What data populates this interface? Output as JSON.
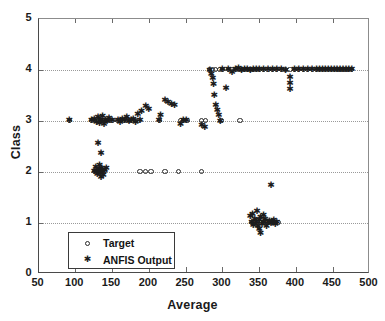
{
  "chart_data": {
    "type": "scatter",
    "title": "",
    "xlabel": "Average",
    "ylabel": "Class",
    "xlim": [
      50,
      500
    ],
    "ylim": [
      0,
      5
    ],
    "xticks": [
      50,
      100,
      150,
      200,
      250,
      300,
      350,
      400,
      450,
      500
    ],
    "yticks": [
      0,
      1,
      2,
      3,
      4,
      5
    ],
    "grid": "horizontal-dotted",
    "legend_position": "lower-left-inside",
    "legend": [
      {
        "label": "Target",
        "marker": "circle-open"
      },
      {
        "label": "ANFIS Output",
        "marker": "asterisk"
      }
    ],
    "series": [
      {
        "name": "Target",
        "marker": "circle-open",
        "points": [
          [
            92,
            3
          ],
          [
            122,
            3
          ],
          [
            126,
            3
          ],
          [
            130,
            3
          ],
          [
            132,
            3
          ],
          [
            134,
            3
          ],
          [
            136,
            3
          ],
          [
            138,
            3
          ],
          [
            140,
            3
          ],
          [
            143,
            3
          ],
          [
            146,
            3
          ],
          [
            150,
            3
          ],
          [
            158,
            3
          ],
          [
            162,
            3
          ],
          [
            166,
            3
          ],
          [
            170,
            3
          ],
          [
            174,
            3
          ],
          [
            178,
            3
          ],
          [
            182,
            3
          ],
          [
            186,
            3
          ],
          [
            214,
            3
          ],
          [
            243,
            3
          ],
          [
            247,
            3
          ],
          [
            252,
            3
          ],
          [
            272,
            3
          ],
          [
            277,
            3
          ],
          [
            298,
            3
          ],
          [
            324,
            3
          ],
          [
            126,
            2
          ],
          [
            130,
            2
          ],
          [
            133,
            2
          ],
          [
            136,
            2
          ],
          [
            139,
            2
          ],
          [
            188,
            2
          ],
          [
            196,
            2
          ],
          [
            203,
            2
          ],
          [
            222,
            2
          ],
          [
            240,
            2
          ],
          [
            272,
            2
          ],
          [
            283,
            4
          ],
          [
            287,
            4
          ],
          [
            291,
            4
          ],
          [
            296,
            4
          ],
          [
            300,
            4
          ],
          [
            308,
            4
          ],
          [
            313,
            4
          ],
          [
            318,
            4
          ],
          [
            322,
            4
          ],
          [
            326,
            4
          ],
          [
            330,
            4
          ],
          [
            334,
            4
          ],
          [
            338,
            4
          ],
          [
            342,
            4
          ],
          [
            346,
            4
          ],
          [
            350,
            4
          ],
          [
            356,
            4
          ],
          [
            362,
            4
          ],
          [
            368,
            4
          ],
          [
            374,
            4
          ],
          [
            380,
            4
          ],
          [
            386,
            4
          ],
          [
            392,
            4
          ],
          [
            398,
            4
          ],
          [
            404,
            4
          ],
          [
            410,
            4
          ],
          [
            416,
            4
          ],
          [
            422,
            4
          ],
          [
            428,
            4
          ],
          [
            432,
            4
          ],
          [
            436,
            4
          ],
          [
            440,
            4
          ],
          [
            444,
            4
          ],
          [
            448,
            4
          ],
          [
            452,
            4
          ],
          [
            456,
            4
          ],
          [
            460,
            4
          ],
          [
            464,
            4
          ],
          [
            468,
            4
          ],
          [
            472,
            4
          ],
          [
            476,
            4
          ],
          [
            340,
            1
          ],
          [
            344,
            1
          ],
          [
            348,
            1
          ],
          [
            352,
            1
          ],
          [
            356,
            1
          ],
          [
            360,
            1
          ],
          [
            364,
            1
          ],
          [
            368,
            1
          ],
          [
            372,
            1
          ],
          [
            376,
            1
          ]
        ]
      },
      {
        "name": "ANFIS Output",
        "marker": "asterisk",
        "points": [
          [
            92,
            3.0
          ],
          [
            122,
            3.0
          ],
          [
            126,
            3.02
          ],
          [
            129,
            2.97
          ],
          [
            131,
            3.05
          ],
          [
            133,
            2.95
          ],
          [
            135,
            3.0
          ],
          [
            137,
            3.08
          ],
          [
            139,
            2.92
          ],
          [
            141,
            3.0
          ],
          [
            143,
            2.98
          ],
          [
            146,
            3.04
          ],
          [
            150,
            3.0
          ],
          [
            158,
            3.0
          ],
          [
            161,
            2.96
          ],
          [
            164,
            3.02
          ],
          [
            167,
            3.0
          ],
          [
            170,
            3.06
          ],
          [
            173,
            2.98
          ],
          [
            176,
            3.0
          ],
          [
            179,
            3.02
          ],
          [
            182,
            2.96
          ],
          [
            185,
            3.12
          ],
          [
            188,
            3.0
          ],
          [
            190,
            3.18
          ],
          [
            214,
            3.0
          ],
          [
            216,
            3.1
          ],
          [
            131,
            2.55
          ],
          [
            243,
            2.92
          ],
          [
            247,
            3.0
          ],
          [
            251,
            3.0
          ],
          [
            196,
            3.28
          ],
          [
            200,
            3.22
          ],
          [
            222,
            3.4
          ],
          [
            226,
            3.35
          ],
          [
            231,
            3.32
          ],
          [
            235,
            3.3
          ],
          [
            272,
            2.9
          ],
          [
            276,
            2.86
          ],
          [
            126,
            2.0
          ],
          [
            128,
            2.08
          ],
          [
            130,
            1.95
          ],
          [
            132,
            2.04
          ],
          [
            134,
            1.97
          ],
          [
            136,
            2.05
          ],
          [
            138,
            1.93
          ],
          [
            140,
            2.02
          ],
          [
            142,
            2.06
          ],
          [
            133,
            2.12
          ],
          [
            135,
            1.88
          ],
          [
            137,
            2.0
          ],
          [
            129,
            2.0
          ],
          [
            131,
            2.0
          ],
          [
            135,
            2.35
          ],
          [
            283,
            3.98
          ],
          [
            285,
            3.9
          ],
          [
            287,
            3.82
          ],
          [
            288,
            3.7
          ],
          [
            289,
            3.5
          ],
          [
            291,
            3.3
          ],
          [
            293,
            3.2
          ],
          [
            295,
            3.1
          ],
          [
            297,
            2.98
          ],
          [
            300,
            4.0
          ],
          [
            305,
            3.62
          ],
          [
            308,
            4.0
          ],
          [
            313,
            3.95
          ],
          [
            318,
            4.0
          ],
          [
            322,
            4.02
          ],
          [
            326,
            3.98
          ],
          [
            330,
            4.0
          ],
          [
            334,
            4.0
          ],
          [
            338,
            3.98
          ],
          [
            342,
            4.0
          ],
          [
            346,
            4.0
          ],
          [
            350,
            4.0
          ],
          [
            356,
            4.0
          ],
          [
            362,
            4.0
          ],
          [
            368,
            4.0
          ],
          [
            374,
            4.0
          ],
          [
            380,
            4.0
          ],
          [
            386,
            3.98
          ],
          [
            392,
            3.85
          ],
          [
            392,
            3.72
          ],
          [
            392,
            3.6
          ],
          [
            398,
            4.0
          ],
          [
            404,
            4.0
          ],
          [
            410,
            4.0
          ],
          [
            416,
            4.0
          ],
          [
            422,
            4.0
          ],
          [
            428,
            4.0
          ],
          [
            432,
            4.0
          ],
          [
            436,
            4.0
          ],
          [
            440,
            4.0
          ],
          [
            444,
            4.0
          ],
          [
            448,
            4.0
          ],
          [
            452,
            4.0
          ],
          [
            456,
            4.0
          ],
          [
            460,
            4.0
          ],
          [
            464,
            4.0
          ],
          [
            468,
            4.0
          ],
          [
            472,
            4.0
          ],
          [
            476,
            4.0
          ],
          [
            366,
            1.72
          ],
          [
            338,
            1.12
          ],
          [
            340,
            1.0
          ],
          [
            342,
            0.95
          ],
          [
            344,
            1.06
          ],
          [
            346,
            1.0
          ],
          [
            348,
            0.92
          ],
          [
            350,
            1.04
          ],
          [
            352,
            1.1
          ],
          [
            354,
            0.96
          ],
          [
            356,
            1.0
          ],
          [
            358,
            1.05
          ],
          [
            360,
            0.93
          ],
          [
            362,
            1.0
          ],
          [
            364,
            1.02
          ],
          [
            366,
            0.98
          ],
          [
            368,
            1.0
          ],
          [
            370,
            1.04
          ],
          [
            372,
            0.97
          ],
          [
            374,
            1.0
          ],
          [
            347,
            1.22
          ],
          [
            352,
            0.78
          ],
          [
            341,
            1.16
          ],
          [
            356,
            1.14
          ],
          [
            350,
            0.86
          ]
        ]
      }
    ]
  }
}
